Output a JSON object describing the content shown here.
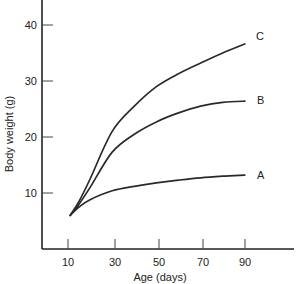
{
  "chart_data": {
    "type": "line",
    "title": "",
    "xlabel": "Age (days)",
    "ylabel": "Body weight (g)",
    "xlim": [
      0,
      110
    ],
    "ylim": [
      0,
      45
    ],
    "xticks": [
      10,
      30,
      50,
      70,
      90
    ],
    "yticks": [
      10,
      20,
      30,
      40
    ],
    "grid": false,
    "legend": "inline labels at curve ends",
    "x": [
      11,
      15,
      20,
      30,
      40,
      50,
      60,
      70,
      80,
      90
    ],
    "series": [
      {
        "name": "A",
        "values": [
          6,
          7.5,
          8.8,
          10.4,
          11.2,
          11.8,
          12.3,
          12.7,
          13.0,
          13.2
        ]
      },
      {
        "name": "B",
        "values": [
          6,
          8.0,
          11.0,
          17.3,
          20.5,
          22.7,
          24.3,
          25.5,
          26.2,
          26.4
        ]
      },
      {
        "name": "C",
        "values": [
          6,
          8.5,
          12.5,
          21.0,
          25.5,
          29.0,
          31.3,
          33.2,
          35.0,
          36.6
        ]
      }
    ]
  },
  "axes": {
    "x_title": "Age (days)",
    "y_title": "Body weight (g)",
    "x_tick_labels": [
      "10",
      "30",
      "50",
      "70",
      "90"
    ],
    "y_tick_labels": [
      "10",
      "20",
      "30",
      "40"
    ]
  },
  "series_labels": [
    "A",
    "B",
    "C"
  ]
}
